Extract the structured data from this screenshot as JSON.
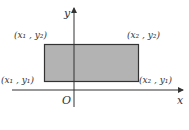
{
  "diagram": {
    "type": "coordinate-plane-rectangle",
    "axes": {
      "x_label": "x",
      "y_label": "y",
      "origin_label": "O"
    },
    "rectangle": {
      "fill": "#b3b3b3",
      "stroke": "#333333",
      "corners": {
        "top_left": "(x₁ , y₂)",
        "top_right": "(x₂ , y₂)",
        "bottom_left": "(x₁ , y₁)",
        "bottom_right": "(x₂ , y₁)"
      }
    }
  }
}
